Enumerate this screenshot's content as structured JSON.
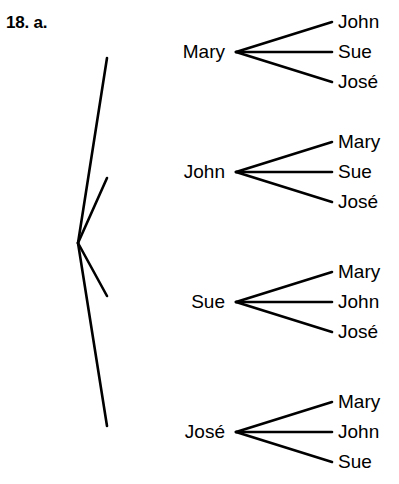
{
  "page": {
    "clipped_text_above": "",
    "exercise_label": "18. a."
  },
  "tree": {
    "root": {
      "name": "root-vertex",
      "x": 78,
      "y": 243
    },
    "branches": [
      {
        "label": "Mary",
        "label_x": 225,
        "label_y": 52,
        "vertex_x": 236,
        "vertex_y": 52,
        "leaves": [
          {
            "label": "John",
            "x": 338,
            "y": 22
          },
          {
            "label": "Sue",
            "x": 338,
            "y": 52
          },
          {
            "label": "José",
            "x": 338,
            "y": 82
          }
        ]
      },
      {
        "label": "John",
        "label_x": 225,
        "label_y": 172,
        "vertex_x": 236,
        "vertex_y": 172,
        "leaves": [
          {
            "label": "Mary",
            "x": 338,
            "y": 142
          },
          {
            "label": "Sue",
            "x": 338,
            "y": 172
          },
          {
            "label": "José",
            "x": 338,
            "y": 202
          }
        ]
      },
      {
        "label": "Sue",
        "label_x": 225,
        "label_y": 302,
        "vertex_x": 236,
        "vertex_y": 302,
        "leaves": [
          {
            "label": "Mary",
            "x": 338,
            "y": 272
          },
          {
            "label": "John",
            "x": 338,
            "y": 302
          },
          {
            "label": "José",
            "x": 338,
            "y": 332
          }
        ]
      },
      {
        "label": "José",
        "label_x": 225,
        "label_y": 432,
        "vertex_x": 236,
        "vertex_y": 432,
        "leaves": [
          {
            "label": "Mary",
            "x": 338,
            "y": 402
          },
          {
            "label": "John",
            "x": 338,
            "y": 432
          },
          {
            "label": "Sue",
            "x": 338,
            "y": 462
          }
        ]
      }
    ],
    "style": {
      "line_color": "#000000",
      "line_width": 2.6,
      "background": "#ffffff"
    }
  }
}
